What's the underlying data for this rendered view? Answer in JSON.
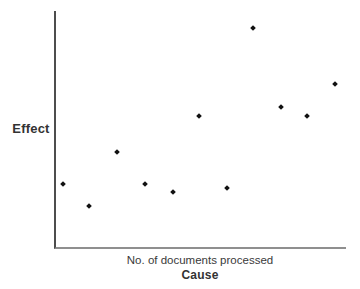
{
  "chart_data": {
    "type": "scatter",
    "title": "",
    "xlabel": "No. of documents processed",
    "xlabel_secondary": "Cause",
    "ylabel": "Effect",
    "legend": null,
    "gridlines": false,
    "axis_ticks": [],
    "axis_tick_labels": [],
    "layout": {
      "axes_shown": [
        "left",
        "bottom"
      ],
      "y_axis_color": "#4d4d4d",
      "x_axis_color": "#8f8f8f",
      "marker_shape": "diamond",
      "marker_color": "#111111",
      "text_color": "#333333",
      "background_color": "#ffffff"
    },
    "points_note": "Axes have no numeric scale; point positions given as percent of plot area from left (x_pct) and from bottom (y_pct).",
    "points": [
      {
        "x_pct": 2.3,
        "y_pct": 26.9
      },
      {
        "x_pct": 11.5,
        "y_pct": 17.2
      },
      {
        "x_pct": 21.2,
        "y_pct": 40.2
      },
      {
        "x_pct": 30.7,
        "y_pct": 26.9
      },
      {
        "x_pct": 40.2,
        "y_pct": 23.1
      },
      {
        "x_pct": 49.4,
        "y_pct": 55.7
      },
      {
        "x_pct": 59.1,
        "y_pct": 25.0
      },
      {
        "x_pct": 68.1,
        "y_pct": 92.8
      },
      {
        "x_pct": 77.5,
        "y_pct": 59.4
      },
      {
        "x_pct": 86.7,
        "y_pct": 55.7
      },
      {
        "x_pct": 96.2,
        "y_pct": 69.2
      }
    ]
  }
}
